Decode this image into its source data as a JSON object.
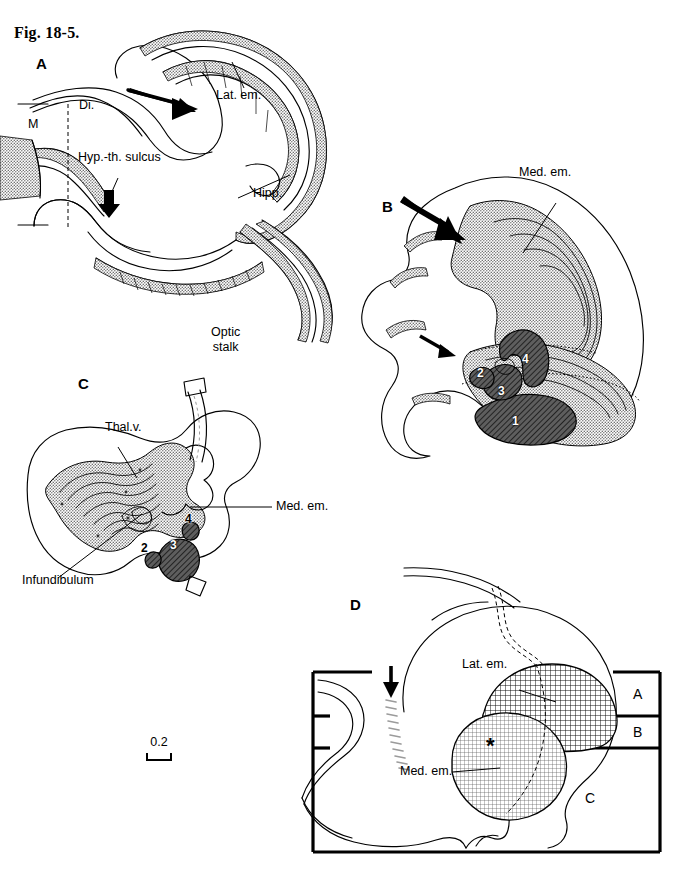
{
  "figure": {
    "caption": "Fig. 18-5.",
    "scale_value": "0.2"
  },
  "panels": {
    "a": {
      "label": "A",
      "annotations": [
        {
          "name": "lat-em",
          "text": "Lat. em."
        },
        {
          "name": "di",
          "text": "Di."
        },
        {
          "name": "m",
          "text": "M"
        },
        {
          "name": "hyp-th-sulcus",
          "text": "Hyp.-th. sulcus"
        },
        {
          "name": "hipp",
          "text": "Hipp."
        }
      ]
    },
    "b": {
      "label": "B",
      "annotations": [
        {
          "name": "med-em",
          "text": "Med. em."
        }
      ],
      "nuclei": [
        "1",
        "2",
        "3",
        "4"
      ]
    },
    "c": {
      "label": "C",
      "annotations": [
        {
          "name": "optic-stalk",
          "text": "Optic\nstalk"
        },
        {
          "name": "thal-v",
          "text": "Thal.v."
        },
        {
          "name": "med-em",
          "text": "Med. em."
        },
        {
          "name": "infundibulum",
          "text": "Infundibulum"
        }
      ],
      "nuclei": [
        "2",
        "3",
        "4"
      ]
    },
    "d": {
      "label": "D",
      "annotations": [
        {
          "name": "lat-em",
          "text": "Lat. em."
        },
        {
          "name": "med-em",
          "text": "Med. em."
        },
        {
          "name": "asterisk",
          "text": "*"
        }
      ],
      "section_levels": [
        "A",
        "B",
        "C"
      ]
    }
  },
  "colors": {
    "ink": "#000000",
    "stipple_gray": "#8c8c8c",
    "dark_hatch": "#4a4a4a",
    "paper": "#ffffff"
  }
}
